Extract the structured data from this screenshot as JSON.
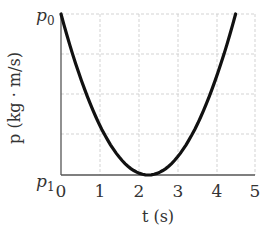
{
  "chart_data": {
    "type": "line",
    "title": "",
    "xlabel": "t (s)",
    "ylabel": "p (kg · m/s)",
    "xlim": [
      0,
      5
    ],
    "ylim": [
      "p1",
      "p0"
    ],
    "x_ticks": [
      "0",
      "1",
      "2",
      "3",
      "4",
      "5"
    ],
    "y_ticks": [
      "p1",
      "p0"
    ],
    "grid": true,
    "series": [
      {
        "name": "momentum",
        "shape": "parabola (upward), vertex at t≈2.25 at p1, p0 at t=0 and t≈4.5",
        "x": [
          0,
          0.5,
          1,
          1.5,
          2,
          2.25,
          2.5,
          3,
          3.5,
          4,
          4.5
        ],
        "y_normalized": [
          1.0,
          0.605,
          0.309,
          0.111,
          0.012,
          0.0,
          0.012,
          0.111,
          0.309,
          0.605,
          1.0
        ]
      }
    ]
  },
  "labels": {
    "y_top": "p",
    "y_top_sub": "0",
    "y_bottom": "p",
    "y_bottom_sub": "1",
    "y_axis_title": "p (kg · m/s)",
    "x_axis_title": "t (s)",
    "x_ticks": [
      "0",
      "1",
      "2",
      "3",
      "4",
      "5"
    ]
  }
}
